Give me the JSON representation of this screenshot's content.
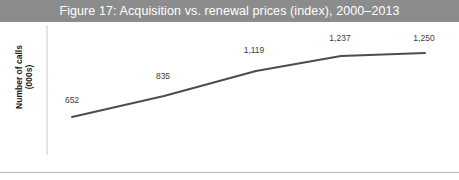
{
  "figure": {
    "title": "Figure 17: Acquisition vs. renewal prices (index), 2000–2013",
    "title_bar_color": "#8c8c8c",
    "title_text_color": "#ffffff",
    "background_color": "#ffffff",
    "rule_color": "#b8b8b8"
  },
  "axis": {
    "ylabel_line1": "Number of calls",
    "ylabel_line2": "(000s)",
    "axis_line_color": "#c9c9c9"
  },
  "chart_data": {
    "type": "line",
    "title": "Figure 17: Acquisition vs. renewal prices (index), 2000–2013",
    "xlabel": "",
    "ylabel": "Number of calls (000s)",
    "grid": false,
    "legend": "none",
    "line_color": "#4d4d4d",
    "line_width": 2,
    "categories": [
      "",
      "",
      "",
      "",
      ""
    ],
    "x": [
      0,
      1,
      2,
      3,
      4
    ],
    "values": [
      652,
      835,
      1119,
      1237,
      1250
    ],
    "point_labels": [
      "652",
      "835",
      "1,119",
      "1,237",
      "1,250"
    ],
    "ylim": [
      0,
      1400
    ],
    "xlim": [
      0,
      4
    ],
    "series": [
      {
        "name": "Number of calls (000s)",
        "values": [
          652,
          835,
          1119,
          1237,
          1250
        ]
      }
    ]
  },
  "points": [
    {
      "label": "652",
      "px": 72,
      "py": 117,
      "lx": 72,
      "ly": 95
    },
    {
      "label": "835",
      "px": 164,
      "py": 96,
      "lx": 163,
      "ly": 71
    },
    {
      "label": "1,119",
      "px": 256,
      "py": 71,
      "lx": 254,
      "ly": 45
    },
    {
      "label": "1,237",
      "px": 341,
      "py": 56,
      "lx": 340,
      "ly": 33
    },
    {
      "label": "1,250",
      "px": 425,
      "py": 53,
      "lx": 424,
      "ly": 33
    }
  ]
}
